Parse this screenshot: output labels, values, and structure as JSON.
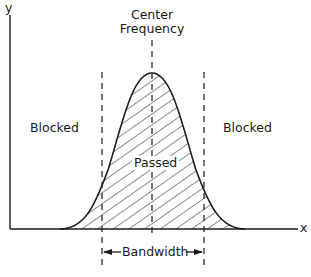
{
  "diagram": {
    "axes": {
      "y_label": "y",
      "x_label": "x"
    },
    "labels": {
      "center_line1": "Center",
      "center_line2": "Frequency",
      "blocked_left": "Blocked",
      "blocked_right": "Blocked",
      "passed": "Passed",
      "bandwidth": "Bandwidth"
    },
    "colors": {
      "ink": "#1a1a1a",
      "background": "#ffffff"
    }
  }
}
